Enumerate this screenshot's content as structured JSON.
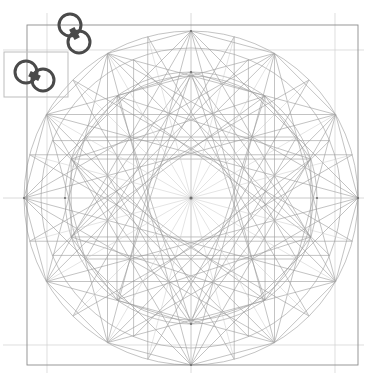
{
  "document": {
    "title": "Geometric Construction Diagram",
    "background_color": "#ffffff",
    "width": 375,
    "height": 373
  },
  "style": {
    "construction_line_color": "#9a9a9a",
    "construction_line_color_faint": "#c9c9c9",
    "frame_color": "#8c8c8c",
    "guide_color": "#d0d0d0",
    "marker_color": "#4a4a4a",
    "selection_box_color": "#bdbdbd",
    "node_color": "#6e6e6e",
    "construction_line_width": 0.6,
    "frame_line_width": 0.9,
    "marker_line_width": 3
  },
  "geometry": {
    "center": {
      "x": 191,
      "y": 198
    },
    "frame": {
      "name": "outer-square",
      "left": 27,
      "top": 25,
      "right": 358,
      "bottom": 365
    },
    "inner_guides": {
      "name": "offset-guide-lines",
      "vertical": [
        47,
        335
      ],
      "horizontal": [
        50,
        345
      ]
    },
    "axes": {
      "horizontal_y": 198,
      "vertical_x": 191
    },
    "circles": [
      {
        "name": "outer-circle",
        "radius": 167
      },
      {
        "name": "second-circle",
        "radius": 150
      },
      {
        "name": "third-circle",
        "radius": 126
      },
      {
        "name": "inner-circle",
        "radius": 122
      }
    ],
    "polygons": [
      {
        "name": "dodecagon-outer",
        "sides": 12,
        "radius": 167,
        "rotation": 0,
        "step": 1
      },
      {
        "name": "star-12-5-outer",
        "sides": 12,
        "radius": 167,
        "rotation": 0,
        "step": 5
      },
      {
        "name": "star-12-4-outer",
        "sides": 12,
        "radius": 167,
        "rotation": 0,
        "step": 4
      },
      {
        "name": "star-12-3-outer",
        "sides": 12,
        "radius": 167,
        "rotation": 0,
        "step": 3
      },
      {
        "name": "star-12-5-rotated",
        "sides": 12,
        "radius": 167,
        "rotation": 15,
        "step": 5
      },
      {
        "name": "star-10-3-inner",
        "sides": 10,
        "radius": 126,
        "rotation": 90,
        "step": 3
      },
      {
        "name": "star-10-4-inner",
        "sides": 10,
        "radius": 126,
        "rotation": 90,
        "step": 4
      },
      {
        "name": "decagon-inner",
        "sides": 10,
        "radius": 126,
        "rotation": 90,
        "step": 1
      },
      {
        "name": "star-8-3-mid",
        "sides": 8,
        "radius": 150,
        "rotation": 22.5,
        "step": 3
      },
      {
        "name": "hexagram-core",
        "sides": 6,
        "radius": 122,
        "rotation": 90,
        "step": 2
      }
    ],
    "radial_spokes": {
      "name": "center-spokes",
      "count": 24,
      "radius": 167
    }
  },
  "markers": [
    {
      "name": "link-marker-upper",
      "circle_a": {
        "x": 70,
        "y": 25,
        "r": 11
      },
      "circle_b": {
        "x": 79,
        "y": 42,
        "r": 11
      },
      "label": "link-marker"
    },
    {
      "name": "link-marker-lower",
      "circle_a": {
        "x": 26,
        "y": 72,
        "r": 11
      },
      "circle_b": {
        "x": 43,
        "y": 80,
        "r": 11
      },
      "label": "link-marker"
    }
  ],
  "selection": {
    "name": "selection-box",
    "left": 4,
    "top": 52,
    "width": 64,
    "height": 45,
    "label": "selection-rectangle"
  }
}
